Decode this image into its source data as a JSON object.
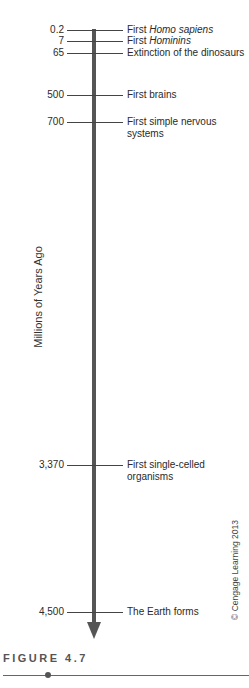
{
  "chart_data": {
    "type": "timeline",
    "title": "",
    "ylabel": "Millions of Years Ago",
    "direction": "downward (increasing time ago)",
    "events": [
      {
        "value": "0.2",
        "label_prefix": "First ",
        "label_italic": "Homo sapiens",
        "label_suffix": "",
        "y": 30
      },
      {
        "value": "7",
        "label_prefix": "First ",
        "label_italic": "Hominins",
        "label_suffix": "",
        "y": 41
      },
      {
        "value": "65",
        "label_prefix": "Extinction of the dinosaurs",
        "label_italic": "",
        "label_suffix": "",
        "y": 53
      },
      {
        "value": "500",
        "label_prefix": "First brains",
        "label_italic": "",
        "label_suffix": "",
        "y": 95
      },
      {
        "value": "700",
        "label_prefix": "First simple nervous systems",
        "label_italic": "",
        "label_suffix": "",
        "y": 122
      },
      {
        "value": "3,370",
        "label_prefix": "First single-celled organisms",
        "label_italic": "",
        "label_suffix": "",
        "y": 465
      },
      {
        "value": "4,500",
        "label_prefix": "The Earth forms",
        "label_italic": "",
        "label_suffix": "",
        "y": 612
      }
    ]
  },
  "axis": {
    "label": "Millions of Years Ago"
  },
  "credit": "© Cengage Learning 2013",
  "figure": {
    "caption": "FIGURE 4.7"
  },
  "colors": {
    "axis": "#555555",
    "text": "#2a2a2a",
    "caption": "#555555"
  }
}
